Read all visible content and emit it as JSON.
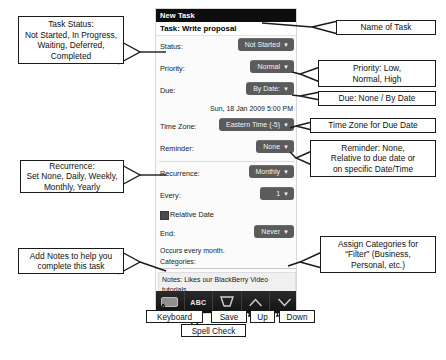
{
  "device": {
    "window_title": "New Task",
    "task_title": "Task: Write proposal",
    "fields": [
      {
        "label": "Status:",
        "value": "Not Started",
        "caret": "▼"
      },
      {
        "label": "Priority:",
        "value": "Normal",
        "caret": "▼"
      },
      {
        "label": "Due:",
        "value": "By Date:",
        "caret": "▼"
      }
    ],
    "due_datetime": "Sun, 18 Jan 2009 5:00 PM",
    "fields2": [
      {
        "label": "Time Zone:",
        "value": "Eastern Time (-5)",
        "caret": "▼"
      },
      {
        "label": "Reminder:",
        "value": "None",
        "caret": "▼"
      }
    ],
    "fields3": [
      {
        "label": "Recurrence:",
        "value": "Monthly",
        "caret": "▼"
      },
      {
        "label": "Every:",
        "value": "1",
        "caret": "▼"
      }
    ],
    "relative_date_label": "Relative Date",
    "end_field": {
      "label": "End:",
      "value": "Never",
      "caret": "▼"
    },
    "occurs_text": "Occurs every month.",
    "categories_label": "Categories:",
    "notes_text": "Notes: Likes our BlackBerry Video tutorials.",
    "toolbar": [
      {
        "name": "keyboard",
        "glyph": ""
      },
      {
        "name": "spell-check",
        "glyph": "ABC"
      },
      {
        "name": "save",
        "glyph": ""
      },
      {
        "name": "up",
        "glyph": ""
      },
      {
        "name": "down",
        "glyph": ""
      }
    ]
  },
  "callouts": {
    "status": "Task Status:\nNot Started, In Progress,\nWaiting, Deferred,\nCompleted",
    "recurrence": "Recurrence:\nSet None, Daily, Weekly,\nMonthly, Yearly",
    "notes": "Add Notes to help you\ncomplete this task",
    "name": "Name of Task",
    "priority": "Priority: Low,\nNormal, High",
    "due": "Due: None / By Date",
    "timezone": "Time Zone for Due Date",
    "reminder": "Reminder: None,\nRelative to due date or\non specific Date/Time",
    "categories": "Assign Categories for\n“Filter” (Business,\nPersonal, etc.)"
  },
  "toolbar_labels": {
    "keyboard": "Keyboard",
    "spell_check": "Spell Check",
    "save": "Save",
    "up": "Up",
    "down": "Down"
  },
  "colors": {
    "titlebar_bg": "#0d0d0d",
    "pill_bg": "#5b5b5b",
    "screen_bg": "#fbfbfb",
    "callout_border": "#1a1a1a"
  }
}
